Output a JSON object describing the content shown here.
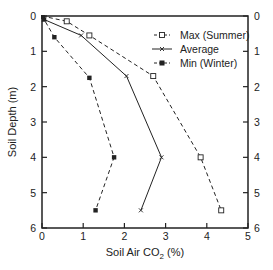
{
  "chart_data": {
    "type": "line",
    "title": "",
    "xlabel": "Soil Air CO2 (%)",
    "xlabel_main": "Soil Air CO",
    "xlabel_sub": "2",
    "xlabel_tail": " (%)",
    "ylabel": "Soil Depth (m)",
    "xlim": [
      0,
      5
    ],
    "ylim": [
      6,
      0
    ],
    "y_inverted": true,
    "grid": false,
    "legend_position": "upper right",
    "x_ticks": [
      "0",
      "1",
      "2",
      "3",
      "4",
      "5"
    ],
    "y_ticks": [
      "0",
      "1",
      "2",
      "3",
      "4",
      "5",
      "6"
    ],
    "right_y_ticks": [
      "0",
      "1",
      "2",
      "3",
      "4",
      "5",
      "6"
    ],
    "series": [
      {
        "name": "Max (Summer)",
        "line_style": "dashed",
        "marker": "open-square",
        "points": [
          [
            0,
            0
          ],
          [
            0.6,
            0.15
          ],
          [
            1.15,
            0.55
          ],
          [
            2.7,
            1.7
          ],
          [
            3.85,
            4.0
          ],
          [
            4.35,
            5.5
          ]
        ]
      },
      {
        "name": "Average",
        "line_style": "solid",
        "marker": "x",
        "points": [
          [
            0,
            0
          ],
          [
            0.05,
            0.1
          ],
          [
            0.95,
            0.55
          ],
          [
            2.05,
            1.7
          ],
          [
            2.9,
            4.0
          ],
          [
            2.4,
            5.5
          ]
        ]
      },
      {
        "name": "Min (Winter)",
        "line_style": "dashed",
        "marker": "filled-square",
        "points": [
          [
            0,
            0
          ],
          [
            0.05,
            0.1
          ],
          [
            0.3,
            0.6
          ],
          [
            1.15,
            1.75
          ],
          [
            1.75,
            4.0
          ],
          [
            1.3,
            5.5
          ]
        ]
      }
    ]
  },
  "legend": {
    "items": [
      {
        "label": "Max (Summer)"
      },
      {
        "label": "Average"
      },
      {
        "label": "Min (Winter)"
      }
    ]
  }
}
